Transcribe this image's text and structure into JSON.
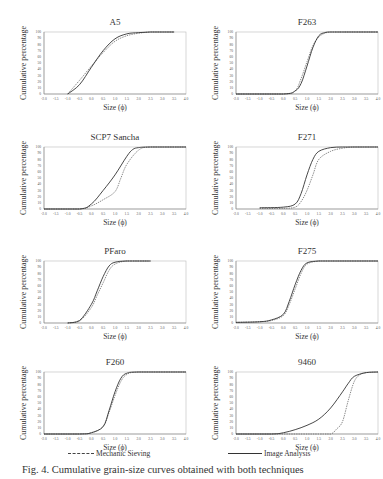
{
  "figure": {
    "legend": {
      "mechanic_sieving": "Mechanic Sieving",
      "image_analysis": "Image Analysis"
    },
    "caption": "Fig. 4. Cumulative grain-size curves obtained with both techniques"
  },
  "chart_data": [
    {
      "type": "line",
      "title": "A5",
      "xlabel": "Size (ϕ)",
      "ylabel": "Cumulative percentage",
      "xlim": [
        -2.0,
        4.0
      ],
      "ylim": [
        0,
        100
      ],
      "xticks": [
        "-2.0",
        "-1.5",
        "-1.0",
        "-0.5",
        "0.0",
        "0.5",
        "1.0",
        "1.5",
        "2.0",
        "2.5",
        "3.0",
        "3.5",
        "4.0"
      ],
      "yticks": [
        "0",
        "10",
        "20",
        "30",
        "40",
        "50",
        "60",
        "70",
        "80",
        "90",
        "100"
      ],
      "series": [
        {
          "name": "Mechanic Sieving",
          "x": [
            -1.0,
            -0.5,
            0.0,
            0.5,
            1.0,
            1.5,
            2.0,
            2.5,
            3.0,
            3.5
          ],
          "y": [
            0,
            22,
            45,
            67,
            85,
            94,
            98,
            100,
            100,
            100
          ]
        },
        {
          "name": "Image Analysis",
          "x": [
            -1.0,
            -0.5,
            0.0,
            0.5,
            1.0,
            1.5,
            2.0,
            2.5,
            3.0,
            3.5
          ],
          "y": [
            0,
            15,
            43,
            70,
            89,
            97,
            99,
            100,
            100,
            100
          ]
        }
      ]
    },
    {
      "type": "line",
      "title": "F263",
      "xlabel": "Size (ϕ)",
      "ylabel": "Cumulative percentage",
      "xlim": [
        -2.0,
        4.0
      ],
      "ylim": [
        0,
        100
      ],
      "xticks": [
        "-2.0",
        "-1.5",
        "-1.0",
        "-0.5",
        "0.0",
        "0.5",
        "1.0",
        "1.5",
        "2.0",
        "2.5",
        "3.0",
        "3.5",
        "4.0"
      ],
      "yticks": [
        "0",
        "10",
        "20",
        "30",
        "40",
        "50",
        "60",
        "70",
        "80",
        "90",
        "100"
      ],
      "series": [
        {
          "name": "Mechanic Sieving",
          "x": [
            -2.0,
            0.0,
            0.5,
            0.75,
            1.0,
            1.25,
            1.5,
            1.75,
            2.0,
            2.5,
            4.0
          ],
          "y": [
            0,
            0,
            5,
            25,
            52,
            78,
            92,
            98,
            100,
            100,
            100
          ]
        },
        {
          "name": "Image Analysis",
          "x": [
            -2.0,
            0.0,
            0.5,
            0.75,
            1.0,
            1.25,
            1.5,
            1.75,
            2.0,
            2.5,
            4.0
          ],
          "y": [
            0,
            0,
            5,
            17,
            45,
            75,
            94,
            99,
            100,
            100,
            100
          ]
        }
      ]
    },
    {
      "type": "line",
      "title": "SCP7 Sancha",
      "xlabel": "Size (ϕ)",
      "ylabel": "Cumulative percentage",
      "xlim": [
        -2.0,
        4.0
      ],
      "ylim": [
        0,
        100
      ],
      "xticks": [
        "-2.0",
        "-1.5",
        "-1.0",
        "-0.5",
        "0.0",
        "0.5",
        "1.0",
        "1.5",
        "2.0",
        "2.5",
        "3.0",
        "3.5",
        "4.0"
      ],
      "yticks": [
        "0",
        "10",
        "20",
        "30",
        "40",
        "50",
        "60",
        "70",
        "80",
        "90",
        "100"
      ],
      "series": [
        {
          "name": "Mechanic Sieving",
          "x": [
            -2.0,
            -0.5,
            0.0,
            0.5,
            1.0,
            1.25,
            1.5,
            2.0,
            2.5,
            4.0
          ],
          "y": [
            0,
            0,
            5,
            15,
            28,
            50,
            72,
            95,
            100,
            100
          ]
        },
        {
          "name": "Image Analysis",
          "x": [
            -2.0,
            -0.5,
            0.0,
            0.5,
            1.0,
            1.5,
            1.75,
            2.0,
            2.5,
            4.0
          ],
          "y": [
            0,
            0,
            8,
            30,
            55,
            85,
            96,
            99,
            100,
            100
          ]
        }
      ]
    },
    {
      "type": "line",
      "title": "F271",
      "xlabel": "Size (ϕ)",
      "ylabel": "Cumulative percentage",
      "xlim": [
        -2.0,
        4.0
      ],
      "ylim": [
        0,
        100
      ],
      "xticks": [
        "-2.0",
        "-1.5",
        "-1.0",
        "-0.5",
        "0.0",
        "0.5",
        "1.0",
        "1.5",
        "2.0",
        "2.5",
        "3.0",
        "3.5",
        "4.0"
      ],
      "yticks": [
        "0",
        "10",
        "20",
        "30",
        "40",
        "50",
        "60",
        "70",
        "80",
        "90",
        "100"
      ],
      "series": [
        {
          "name": "Mechanic Sieving",
          "x": [
            -1.0,
            0.0,
            0.5,
            0.75,
            1.0,
            1.25,
            1.5,
            2.0,
            2.5,
            3.0,
            4.0
          ],
          "y": [
            1,
            1,
            3,
            12,
            30,
            55,
            80,
            93,
            98,
            100,
            100
          ]
        },
        {
          "name": "Image Analysis",
          "x": [
            -1.0,
            0.0,
            0.5,
            0.75,
            1.0,
            1.25,
            1.5,
            2.0,
            2.5,
            3.0,
            4.0
          ],
          "y": [
            2,
            3,
            8,
            25,
            55,
            80,
            93,
            99,
            100,
            100,
            100
          ]
        }
      ]
    },
    {
      "type": "line",
      "title": "PFaro",
      "xlabel": "Size (ϕ)",
      "ylabel": "Cumulative percentage",
      "xlim": [
        -2.0,
        4.0
      ],
      "ylim": [
        0,
        100
      ],
      "xticks": [
        "-2.0",
        "-1.5",
        "-1.0",
        "-0.5",
        "0.0",
        "0.5",
        "1.0",
        "1.5",
        "2.0",
        "2.5",
        "3.0",
        "3.5",
        "4.0"
      ],
      "yticks": [
        "0",
        "10",
        "20",
        "30",
        "40",
        "50",
        "60",
        "70",
        "80",
        "90",
        "100"
      ],
      "series": [
        {
          "name": "Mechanic Sieving",
          "x": [
            -1.0,
            -0.5,
            0.0,
            0.25,
            0.5,
            0.75,
            1.0,
            1.5,
            2.5
          ],
          "y": [
            0,
            3,
            25,
            45,
            65,
            85,
            95,
            100,
            100
          ]
        },
        {
          "name": "Image Analysis",
          "x": [
            -1.0,
            -0.5,
            0.0,
            0.25,
            0.5,
            0.75,
            1.0,
            1.5,
            2.5
          ],
          "y": [
            0,
            4,
            30,
            52,
            75,
            92,
            98,
            100,
            100
          ]
        }
      ]
    },
    {
      "type": "line",
      "title": "F275",
      "xlabel": "Size (ϕ)",
      "ylabel": "Cumulative percentage",
      "xlim": [
        -2.0,
        4.0
      ],
      "ylim": [
        0,
        100
      ],
      "xticks": [
        "-2.0",
        "-1.5",
        "-1.0",
        "-0.5",
        "0.0",
        "0.5",
        "1.0",
        "1.5",
        "2.0",
        "2.5",
        "3.0",
        "3.5",
        "4.0"
      ],
      "yticks": [
        "0",
        "10",
        "20",
        "30",
        "40",
        "50",
        "60",
        "70",
        "80",
        "90",
        "100"
      ],
      "series": [
        {
          "name": "Mechanic Sieving",
          "x": [
            -2.0,
            -1.0,
            -0.5,
            0.0,
            0.25,
            0.5,
            0.75,
            1.0,
            1.5,
            2.0,
            4.0
          ],
          "y": [
            1,
            2,
            4,
            12,
            30,
            55,
            80,
            95,
            100,
            100,
            100
          ]
        },
        {
          "name": "Image Analysis",
          "x": [
            -2.0,
            -1.0,
            -0.5,
            0.0,
            0.25,
            0.5,
            0.75,
            1.0,
            1.5,
            2.0,
            4.0
          ],
          "y": [
            1,
            2,
            5,
            14,
            35,
            62,
            85,
            97,
            100,
            100,
            100
          ]
        }
      ]
    },
    {
      "type": "line",
      "title": "F260",
      "xlabel": "Size (ϕ)",
      "ylabel": "Cumulative percentage",
      "xlim": [
        -2.0,
        4.0
      ],
      "ylim": [
        0,
        100
      ],
      "xticks": [
        "-2.0",
        "-1.5",
        "-1.0",
        "-0.5",
        "0.0",
        "0.5",
        "1.0",
        "1.5",
        "2.0",
        "2.5",
        "3.0",
        "3.5",
        "4.0"
      ],
      "yticks": [
        "0",
        "10",
        "20",
        "30",
        "40",
        "50",
        "60",
        "70",
        "80",
        "90",
        "100"
      ],
      "series": [
        {
          "name": "Mechanic Sieving",
          "x": [
            -2.0,
            -0.5,
            0.0,
            0.5,
            0.75,
            1.0,
            1.25,
            1.5,
            2.0,
            4.0
          ],
          "y": [
            0,
            0,
            2,
            12,
            35,
            62,
            85,
            96,
            100,
            100
          ]
        },
        {
          "name": "Image Analysis",
          "x": [
            -2.0,
            -0.5,
            0.0,
            0.5,
            0.75,
            1.0,
            1.25,
            1.5,
            2.0,
            4.0
          ],
          "y": [
            0,
            0,
            2,
            12,
            38,
            68,
            90,
            98,
            100,
            100
          ]
        }
      ]
    },
    {
      "type": "line",
      "title": "9460",
      "xlabel": "Size (ϕ)",
      "ylabel": "Cumulative percentage",
      "xlim": [
        -2.0,
        4.0
      ],
      "ylim": [
        0,
        100
      ],
      "xticks": [
        "-2.0",
        "-1.5",
        "-1.0",
        "-0.5",
        "0.0",
        "0.5",
        "1.0",
        "1.5",
        "2.0",
        "2.5",
        "3.0",
        "3.5",
        "4.0"
      ],
      "yticks": [
        "0",
        "10",
        "20",
        "30",
        "40",
        "50",
        "60",
        "70",
        "80",
        "90",
        "100"
      ],
      "series": [
        {
          "name": "Mechanic Sieving",
          "x": [
            -2.0,
            1.5,
            2.0,
            2.25,
            2.5,
            2.75,
            3.0,
            3.25,
            3.5,
            4.0
          ],
          "y": [
            0,
            0,
            0,
            8,
            20,
            55,
            85,
            96,
            99,
            100
          ]
        },
        {
          "name": "Image Analysis",
          "x": [
            -2.0,
            -0.5,
            0.0,
            0.5,
            1.0,
            1.5,
            2.0,
            2.5,
            2.75,
            3.0,
            3.5,
            4.0
          ],
          "y": [
            0,
            0,
            2,
            7,
            14,
            24,
            42,
            68,
            82,
            93,
            99,
            100
          ]
        }
      ]
    }
  ]
}
